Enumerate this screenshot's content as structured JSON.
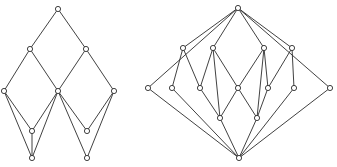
{
  "figure": {
    "title": "",
    "caption": "",
    "background_color": "#ffffff",
    "stroke_color": "#2b2b2b",
    "node_fill_color": "#ffffff",
    "node_radius": 2.6,
    "edge_width": 0.9,
    "width": 337,
    "height": 167
  },
  "diagrams": [
    {
      "id": "left-poset-diagram",
      "name": "left-hasse-diagram",
      "label": "",
      "node_count": 10,
      "edge_count": 15,
      "nodes": [
        {
          "id": "L0",
          "label": "",
          "x": 58,
          "y": 9,
          "rank": 0
        },
        {
          "id": "L1",
          "label": "",
          "x": 30,
          "y": 49,
          "rank": 1
        },
        {
          "id": "L2",
          "label": "",
          "x": 86,
          "y": 49,
          "rank": 1
        },
        {
          "id": "L3",
          "label": "",
          "x": 4,
          "y": 91,
          "rank": 2
        },
        {
          "id": "L4",
          "label": "",
          "x": 58,
          "y": 91,
          "rank": 2
        },
        {
          "id": "L5",
          "label": "",
          "x": 114,
          "y": 91,
          "rank": 2
        },
        {
          "id": "L6",
          "label": "",
          "x": 32,
          "y": 131,
          "rank": 3
        },
        {
          "id": "L7",
          "label": "",
          "x": 87,
          "y": 131,
          "rank": 3
        },
        {
          "id": "L8",
          "label": "",
          "x": 32,
          "y": 158,
          "rank": 4
        },
        {
          "id": "L9",
          "label": "",
          "x": 87,
          "y": 158,
          "rank": 4
        }
      ],
      "edges": [
        {
          "from": "L0",
          "to": "L1"
        },
        {
          "from": "L0",
          "to": "L2"
        },
        {
          "from": "L1",
          "to": "L3"
        },
        {
          "from": "L1",
          "to": "L4"
        },
        {
          "from": "L2",
          "to": "L4"
        },
        {
          "from": "L2",
          "to": "L5"
        },
        {
          "from": "L3",
          "to": "L6"
        },
        {
          "from": "L3",
          "to": "L8"
        },
        {
          "from": "L4",
          "to": "L6"
        },
        {
          "from": "L4",
          "to": "L7"
        },
        {
          "from": "L4",
          "to": "L8"
        },
        {
          "from": "L4",
          "to": "L9"
        },
        {
          "from": "L5",
          "to": "L7"
        },
        {
          "from": "L5",
          "to": "L9"
        },
        {
          "from": "L6",
          "to": "L8"
        }
      ]
    },
    {
      "id": "right-poset-diagram",
      "name": "right-hasse-diagram",
      "label": "",
      "node_count": 14,
      "edge_count": 26,
      "nodes": [
        {
          "id": "R0",
          "label": "",
          "x": 238,
          "y": 8,
          "rank": 0
        },
        {
          "id": "R1",
          "label": "",
          "x": 183,
          "y": 48,
          "rank": 1
        },
        {
          "id": "R2",
          "label": "",
          "x": 213,
          "y": 48,
          "rank": 1
        },
        {
          "id": "R3",
          "label": "",
          "x": 264,
          "y": 48,
          "rank": 1
        },
        {
          "id": "R4",
          "label": "",
          "x": 292,
          "y": 48,
          "rank": 1
        },
        {
          "id": "R5",
          "label": "",
          "x": 148,
          "y": 88,
          "rank": 2
        },
        {
          "id": "R6",
          "label": "",
          "x": 172,
          "y": 88,
          "rank": 2
        },
        {
          "id": "R7",
          "label": "",
          "x": 200,
          "y": 88,
          "rank": 2
        },
        {
          "id": "R8",
          "label": "",
          "x": 238,
          "y": 88,
          "rank": 2
        },
        {
          "id": "R9",
          "label": "",
          "x": 268,
          "y": 88,
          "rank": 2
        },
        {
          "id": "R10",
          "label": "",
          "x": 294,
          "y": 88,
          "rank": 2
        },
        {
          "id": "R11",
          "label": "",
          "x": 330,
          "y": 88,
          "rank": 2
        },
        {
          "id": "R12",
          "label": "",
          "x": 220,
          "y": 118,
          "rank": 3
        },
        {
          "id": "R13",
          "label": "",
          "x": 257,
          "y": 118,
          "rank": 3
        },
        {
          "id": "R14",
          "label": "",
          "x": 239,
          "y": 158,
          "rank": 4
        }
      ],
      "edges": [
        {
          "from": "R0",
          "to": "R1"
        },
        {
          "from": "R0",
          "to": "R2"
        },
        {
          "from": "R0",
          "to": "R3"
        },
        {
          "from": "R0",
          "to": "R4"
        },
        {
          "from": "R0",
          "to": "R5"
        },
        {
          "from": "R0",
          "to": "R11"
        },
        {
          "from": "R1",
          "to": "R6"
        },
        {
          "from": "R1",
          "to": "R7"
        },
        {
          "from": "R2",
          "to": "R7"
        },
        {
          "from": "R2",
          "to": "R8"
        },
        {
          "from": "R3",
          "to": "R8"
        },
        {
          "from": "R3",
          "to": "R9"
        },
        {
          "from": "R4",
          "to": "R9"
        },
        {
          "from": "R4",
          "to": "R10"
        },
        {
          "from": "R5",
          "to": "R14"
        },
        {
          "from": "R6",
          "to": "R14"
        },
        {
          "from": "R7",
          "to": "R12"
        },
        {
          "from": "R8",
          "to": "R12"
        },
        {
          "from": "R8",
          "to": "R13"
        },
        {
          "from": "R9",
          "to": "R13"
        },
        {
          "from": "R10",
          "to": "R14"
        },
        {
          "from": "R11",
          "to": "R14"
        },
        {
          "from": "R12",
          "to": "R14"
        },
        {
          "from": "R13",
          "to": "R14"
        },
        {
          "from": "R3",
          "to": "R13"
        },
        {
          "from": "R2",
          "to": "R12"
        }
      ]
    }
  ]
}
